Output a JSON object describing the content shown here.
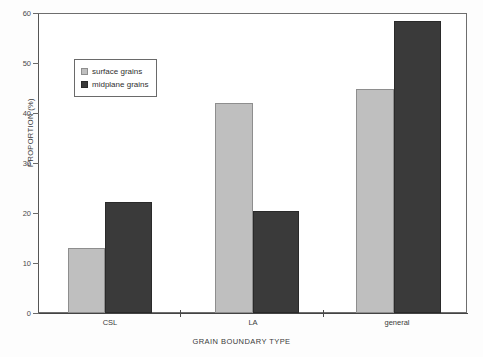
{
  "chart_data": {
    "type": "bar",
    "title": "",
    "xlabel": "GRAIN BOUNDARY TYPE",
    "ylabel": "PROPORTION (%)",
    "categories": [
      "CSL",
      "LA",
      "general"
    ],
    "series": [
      {
        "name": "surface grains",
        "color": "#bfbfbf",
        "values": [
          13.0,
          42.2,
          45.0
        ]
      },
      {
        "name": "midplane grains",
        "color": "#3a3a3a",
        "values": [
          22.2,
          20.4,
          58.6
        ]
      }
    ],
    "ylim": [
      0,
      60
    ],
    "yticks": [
      0,
      10,
      20,
      30,
      40,
      50,
      60
    ],
    "ytick_labels": [
      "0",
      "10",
      "20",
      "30",
      "40",
      "50",
      "60"
    ],
    "grid": false,
    "legend_position": "upper-left",
    "legend_entries": [
      "surface grains",
      "midplane grains"
    ]
  },
  "axes": {
    "y": {
      "label": "PROPORTION (%)",
      "ticks": [
        {
          "value": 60,
          "label": "60"
        },
        {
          "value": 50,
          "label": "50"
        },
        {
          "value": 40,
          "label": "40"
        },
        {
          "value": 30,
          "label": "30"
        },
        {
          "value": 20,
          "label": "20"
        },
        {
          "value": 10,
          "label": "10"
        },
        {
          "value": 0,
          "label": "0"
        }
      ]
    },
    "x": {
      "label": "GRAIN BOUNDARY TYPE",
      "ticks": [
        {
          "label": "CSL"
        },
        {
          "label": "LA"
        },
        {
          "label": "general"
        }
      ]
    }
  },
  "legend": {
    "items": [
      {
        "label": "surface grains",
        "swatch": "light-gray-swatch"
      },
      {
        "label": "midplane grains",
        "swatch": "dark-gray-swatch"
      }
    ]
  }
}
